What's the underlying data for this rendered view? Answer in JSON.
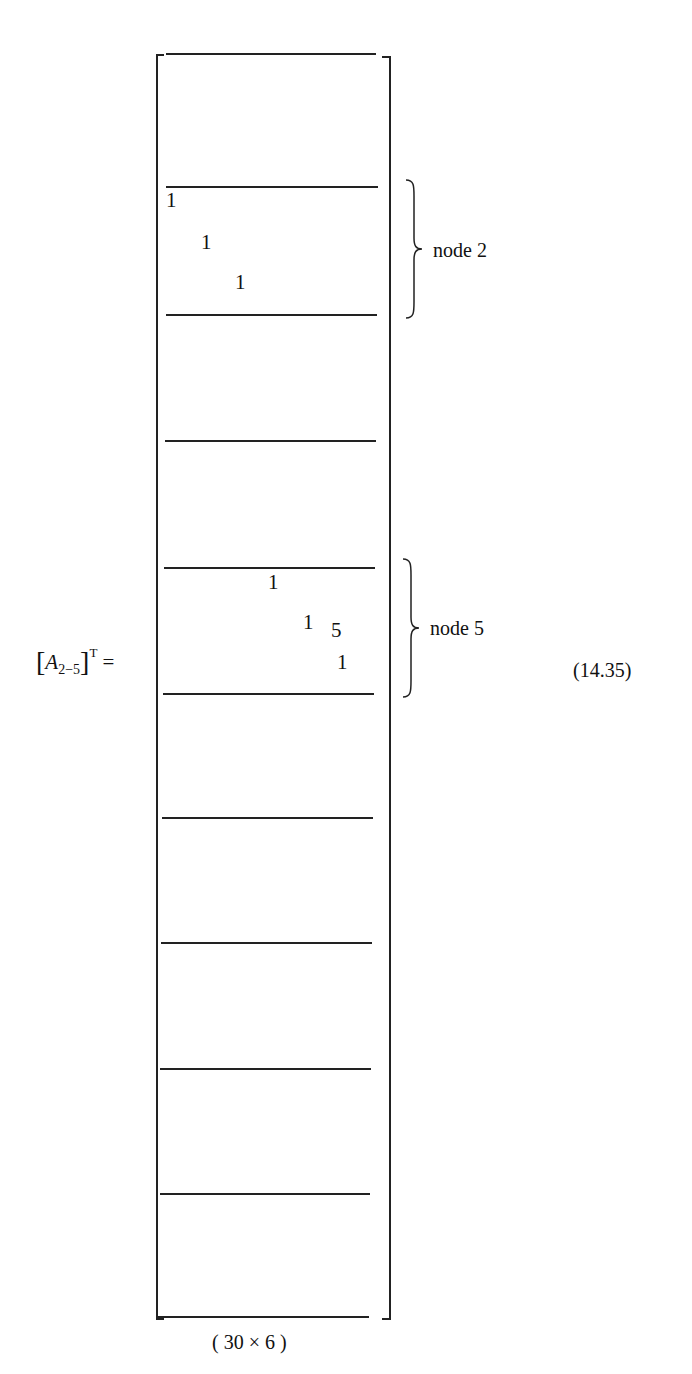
{
  "equation": {
    "lhs": {
      "open_bracket": "[",
      "symbol": "A",
      "subscript": "2−5",
      "close_bracket": "]",
      "superscript": "T",
      "equals": "="
    },
    "number": "(14.35)",
    "dimension_label": "( 30 × 6 )"
  },
  "matrix": {
    "rows": 30,
    "cols": 6,
    "block_separator_y": [
      53,
      186,
      314,
      440,
      567,
      693,
      817,
      942,
      1068,
      1193,
      1316
    ],
    "blocks": [
      {
        "label": "node 2",
        "entries": [
          {
            "value": "1",
            "x": 166,
            "y": 190
          },
          {
            "value": "1",
            "x": 201,
            "y": 232
          },
          {
            "value": "1",
            "x": 235,
            "y": 272
          }
        ]
      },
      {
        "label": "node 5",
        "entries": [
          {
            "value": "1",
            "x": 268,
            "y": 572
          },
          {
            "value": "1",
            "x": 303,
            "y": 612
          },
          {
            "value": "5",
            "x": 331,
            "y": 620
          },
          {
            "value": "1",
            "x": 337,
            "y": 652
          }
        ]
      }
    ]
  }
}
